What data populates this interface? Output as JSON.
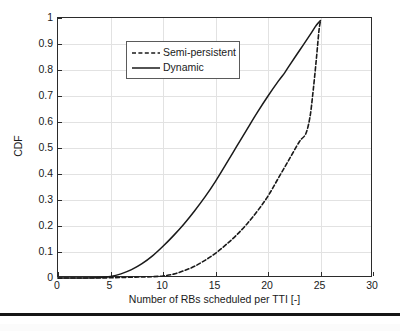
{
  "chart_data": {
    "type": "line",
    "title": "",
    "xlabel": "Number of RBs scheduled per TTI [-]",
    "ylabel": "CDF",
    "xlim": [
      0,
      30
    ],
    "ylim": [
      0,
      1
    ],
    "xticks": [
      0,
      5,
      10,
      15,
      20,
      25,
      30
    ],
    "yticks": [
      0,
      0.1,
      0.2,
      0.3,
      0.4,
      0.5,
      0.6,
      0.7,
      0.8,
      0.9,
      1
    ],
    "xtick_labels": [
      "0",
      "5",
      "10",
      "15",
      "20",
      "25",
      "30"
    ],
    "ytick_labels": [
      "0",
      "0.1",
      "0.2",
      "0.3",
      "0.4",
      "0.5",
      "0.6",
      "0.7",
      "0.8",
      "0.9",
      "1"
    ],
    "grid": true,
    "legend_position": "upper left",
    "series": [
      {
        "name": "Semi-persistent",
        "style": "dashed",
        "color": "#1a1a1a",
        "points": [
          [
            0,
            0.0
          ],
          [
            2,
            0.0
          ],
          [
            4,
            0.0
          ],
          [
            6,
            0.002
          ],
          [
            8,
            0.004
          ],
          [
            9,
            0.005
          ],
          [
            10,
            0.008
          ],
          [
            11,
            0.015
          ],
          [
            12,
            0.028
          ],
          [
            13,
            0.045
          ],
          [
            14,
            0.068
          ],
          [
            15,
            0.095
          ],
          [
            16,
            0.128
          ],
          [
            17,
            0.165
          ],
          [
            18,
            0.208
          ],
          [
            19,
            0.258
          ],
          [
            20,
            0.315
          ],
          [
            21,
            0.385
          ],
          [
            22,
            0.455
          ],
          [
            23,
            0.525
          ],
          [
            23.6,
            0.555
          ],
          [
            24,
            0.62
          ],
          [
            24.3,
            0.72
          ],
          [
            24.6,
            0.84
          ],
          [
            24.85,
            0.95
          ],
          [
            25,
            0.99
          ]
        ]
      },
      {
        "name": "Dynamic",
        "style": "solid",
        "color": "#1a1a1a",
        "points": [
          [
            0,
            0.0
          ],
          [
            2,
            0.0
          ],
          [
            4,
            0.002
          ],
          [
            5,
            0.006
          ],
          [
            6,
            0.016
          ],
          [
            7,
            0.032
          ],
          [
            8,
            0.055
          ],
          [
            9,
            0.085
          ],
          [
            10,
            0.122
          ],
          [
            11,
            0.163
          ],
          [
            12,
            0.208
          ],
          [
            13,
            0.258
          ],
          [
            14,
            0.312
          ],
          [
            15,
            0.372
          ],
          [
            16,
            0.438
          ],
          [
            17,
            0.505
          ],
          [
            18,
            0.572
          ],
          [
            19,
            0.638
          ],
          [
            20,
            0.7
          ],
          [
            21,
            0.758
          ],
          [
            21.6,
            0.79
          ],
          [
            22,
            0.815
          ],
          [
            23,
            0.875
          ],
          [
            24,
            0.935
          ],
          [
            24.6,
            0.972
          ],
          [
            25,
            0.99
          ]
        ]
      }
    ]
  },
  "legend": {
    "items": [
      {
        "label": "Semi-persistent",
        "style": "dashed"
      },
      {
        "label": "Dynamic",
        "style": "solid"
      }
    ]
  },
  "axes": {
    "x_title": "Number of RBs scheduled per TTI [-]",
    "y_title": "CDF"
  }
}
